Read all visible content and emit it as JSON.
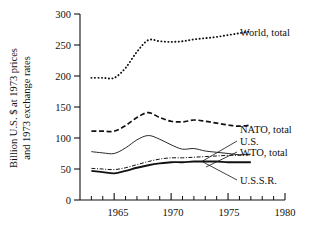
{
  "chart_data": {
    "type": "line",
    "title": "",
    "xlabel": "",
    "ylabel": "Billion U.S. $ at 1973 prices and 1973 exchange rates",
    "ylabel_line1": "Billion U.S. $ at 1973 prices",
    "ylabel_line2": "and 1973 exchange rates",
    "xlim": [
      1962,
      1980
    ],
    "ylim": [
      0,
      300
    ],
    "grid": false,
    "legend_position": "right-inline-labels",
    "x_ticks_major": [
      1965,
      1970,
      1975,
      1980
    ],
    "x_tick_labels": [
      "1965",
      "1970",
      "1975",
      "1980"
    ],
    "x_ticks_minor": [
      1963,
      1964,
      1966,
      1967,
      1968,
      1969,
      1971,
      1972,
      1973,
      1974,
      1976,
      1977,
      1978,
      1979
    ],
    "y_ticks": [
      0,
      50,
      100,
      150,
      200,
      250,
      300
    ],
    "y_tick_labels": [
      "0",
      "50",
      "100",
      "150",
      "200",
      "250",
      "300"
    ],
    "x": [
      1963,
      1964,
      1965,
      1966,
      1967,
      1968,
      1969,
      1970,
      1971,
      1972,
      1973,
      1974,
      1975,
      1976,
      1977
    ],
    "series": [
      {
        "name": "World, total",
        "label": "World, total",
        "style": "dotted",
        "color": "#111111",
        "values": [
          197,
          197,
          197,
          213,
          239,
          258,
          256,
          255,
          256,
          259,
          261,
          263,
          266,
          269,
          272
        ]
      },
      {
        "name": "NATO, total",
        "label": "NATO, total",
        "style": "dashed",
        "color": "#111111",
        "values": [
          111,
          111,
          111,
          120,
          133,
          141,
          133,
          127,
          126,
          129,
          127,
          124,
          121,
          119,
          121
        ]
      },
      {
        "name": "U.S.",
        "label": "U.S.",
        "style": "solid-thin",
        "color": "#111111",
        "values": [
          78,
          76,
          75,
          84,
          97,
          104,
          98,
          89,
          82,
          83,
          79,
          77,
          75,
          73,
          74
        ]
      },
      {
        "name": "WTO, total",
        "label": "WTO, total",
        "style": "dash-dot",
        "color": "#111111",
        "values": [
          51,
          50,
          49,
          52,
          57,
          62,
          66,
          68,
          68,
          69,
          70,
          71,
          72,
          72,
          73
        ]
      },
      {
        "name": "U.S.S.R.",
        "label": "U.S.S.R.",
        "style": "solid-thick",
        "color": "#111111",
        "values": [
          47,
          45,
          43,
          47,
          52,
          56,
          59,
          61,
          61,
          62,
          62,
          62,
          61,
          61,
          61
        ]
      }
    ],
    "annotations": [
      {
        "text": "World, total",
        "at_year": 1977,
        "at_value": 272
      },
      {
        "text": "NATO, total",
        "at_year": 1977,
        "at_value": 121
      },
      {
        "text": "U.S.",
        "at_year": 1977,
        "at_value": 74
      },
      {
        "text": "WTO, total",
        "at_year": 1977,
        "at_value": 73
      },
      {
        "text": "U.S.S.R.",
        "at_year": 1977,
        "at_value": 61
      }
    ]
  }
}
